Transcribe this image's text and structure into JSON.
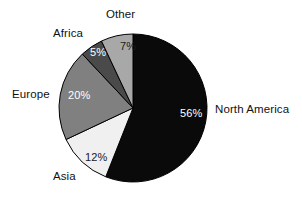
{
  "chart_data": {
    "type": "pie",
    "title": "",
    "subtitle": "",
    "xlabel": "",
    "ylabel": "",
    "legend_position": "none",
    "grid": false,
    "units": "percent",
    "total": 100,
    "categories": [
      "North America",
      "Asia",
      "Europe",
      "Africa",
      "Other"
    ],
    "values": [
      56,
      12,
      20,
      5,
      7
    ],
    "slices": [
      {
        "name": "north-america",
        "label": "North America",
        "value": 56,
        "value_label": "56%",
        "color": "#0a0a0a",
        "label_text_color": "#111111",
        "value_text_color": "#ffffff",
        "start_angle_deg": 0,
        "end_angle_deg": 201.6
      },
      {
        "name": "asia",
        "label": "Asia",
        "value": 12,
        "value_label": "12%",
        "color": "#f0f0f0",
        "label_text_color": "#111111",
        "value_text_color": "#1a1a1a",
        "start_angle_deg": 201.6,
        "end_angle_deg": 244.8
      },
      {
        "name": "europe",
        "label": "Europe",
        "value": 20,
        "value_label": "20%",
        "color": "#808080",
        "label_text_color": "#111111",
        "value_text_color": "#ffffff",
        "start_angle_deg": 244.8,
        "end_angle_deg": 316.8
      },
      {
        "name": "africa",
        "label": "Africa",
        "value": 5,
        "value_label": "5%",
        "color": "#4a4a4a",
        "label_text_color": "#111111",
        "value_text_color": "#ffffff",
        "start_angle_deg": 316.8,
        "end_angle_deg": 334.8
      },
      {
        "name": "other",
        "label": "Other",
        "value": 7,
        "value_label": "7%",
        "color": "#a8a8a8",
        "label_text_color": "#111111",
        "value_text_color": "#1a1a1a",
        "start_angle_deg": 334.8,
        "end_angle_deg": 360
      }
    ],
    "geometry": {
      "center_x": 133,
      "center_y": 108,
      "radius": 74,
      "start_at_twelve_oclock": true,
      "direction": "clockwise"
    },
    "colors": {
      "background": "#ffffff",
      "outline": "#000000",
      "north_america": "#0a0a0a",
      "asia": "#f0f0f0",
      "europe": "#808080",
      "africa": "#4a4a4a",
      "other": "#a8a8a8"
    }
  }
}
